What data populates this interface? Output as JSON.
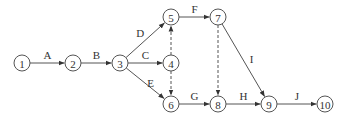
{
  "diagram": {
    "type": "activity-on-arrow network",
    "nodes": [
      {
        "id": "1",
        "label": "1",
        "x": 22,
        "y": 63
      },
      {
        "id": "2",
        "label": "2",
        "x": 73,
        "y": 63
      },
      {
        "id": "3",
        "label": "3",
        "x": 120,
        "y": 63
      },
      {
        "id": "4",
        "label": "4",
        "x": 171,
        "y": 63
      },
      {
        "id": "5",
        "label": "5",
        "x": 171,
        "y": 17
      },
      {
        "id": "6",
        "label": "6",
        "x": 171,
        "y": 104
      },
      {
        "id": "7",
        "label": "7",
        "x": 218,
        "y": 17
      },
      {
        "id": "8",
        "label": "8",
        "x": 218,
        "y": 104
      },
      {
        "id": "9",
        "label": "9",
        "x": 269,
        "y": 104
      },
      {
        "id": "10",
        "label": "10",
        "x": 325,
        "y": 104
      }
    ],
    "edges": [
      {
        "from": "1",
        "to": "2",
        "label": "A",
        "dummy": false
      },
      {
        "from": "2",
        "to": "3",
        "label": "B",
        "dummy": false
      },
      {
        "from": "3",
        "to": "5",
        "label": "D",
        "dummy": false
      },
      {
        "from": "3",
        "to": "4",
        "label": "C",
        "dummy": false
      },
      {
        "from": "3",
        "to": "6",
        "label": "E",
        "dummy": false
      },
      {
        "from": "4",
        "to": "5",
        "label": "",
        "dummy": true
      },
      {
        "from": "4",
        "to": "6",
        "label": "",
        "dummy": true
      },
      {
        "from": "5",
        "to": "7",
        "label": "F",
        "dummy": false
      },
      {
        "from": "6",
        "to": "8",
        "label": "G",
        "dummy": false
      },
      {
        "from": "7",
        "to": "8",
        "label": "",
        "dummy": true
      },
      {
        "from": "7",
        "to": "9",
        "label": "I",
        "dummy": false
      },
      {
        "from": "8",
        "to": "9",
        "label": "H",
        "dummy": false
      },
      {
        "from": "9",
        "to": "10",
        "label": "J",
        "dummy": false
      }
    ]
  }
}
